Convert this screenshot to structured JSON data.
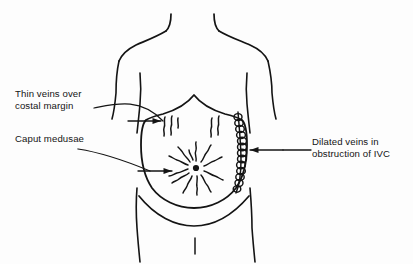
{
  "diagram": {
    "type": "medical-illustration",
    "background_color": "#fdfdfd",
    "ink_color": "#141414"
  },
  "labels": {
    "thin_veins": {
      "line1": "Thin veins over",
      "line2": "costal margin",
      "name": "thin-veins-over-costal-margin"
    },
    "caput": {
      "line1": "Caput medusae",
      "name": "caput-medusae"
    },
    "dilated": {
      "line1": "Dilated veins in",
      "line2": "obstruction of IVC",
      "name": "dilated-veins-ivc-obstruction"
    }
  },
  "features": {
    "torso": "outline of trunk with neck, shoulders, arms and groin",
    "abdomen_shield": "shield-shaped abdominal wall region",
    "umbilicus": "central dark dot",
    "caput_medusae_rays": 12,
    "costal_vein_groups": 2,
    "flank_vein_chain": "vertical chain of dilated overlapping venous loops on right flank",
    "arrows": 3
  }
}
